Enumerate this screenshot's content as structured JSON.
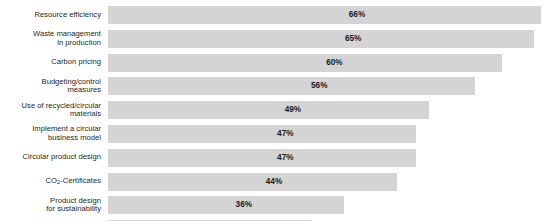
{
  "chart_data": {
    "type": "bar",
    "orientation": "horizontal",
    "title": "",
    "subtitle": "",
    "xlabel": "",
    "ylabel": "",
    "xlim": [
      0,
      70
    ],
    "grid": false,
    "legend": null,
    "value_suffix": "%",
    "categories": [
      "Resource efficiency",
      "Waste management\nin production",
      "Carbon pricing",
      "Budgeting/control\nmeasures",
      "Use of recycled/circular\nmaterials",
      "Implement a circular\nbusiness model",
      "Circular product design",
      "CO2-Certificates",
      "Product design\nfor sustainability",
      "Replenishment control\naccording to demand"
    ],
    "values": [
      66,
      65,
      60,
      56,
      49,
      47,
      47,
      44,
      36,
      31
    ],
    "value_labels": [
      "66%",
      "65%",
      "60%",
      "56%",
      "49%",
      "47%",
      "47%",
      "44%",
      "36%",
      "31%"
    ],
    "bar_color": "#d4d4d4",
    "value_label_color": "#1a1a1a",
    "label_color": "#231f20",
    "background_color": "#ffffff"
  },
  "rows": [
    {
      "label": "Resource efficiency",
      "label_line1": "Resource efficiency",
      "label_line2": "",
      "value": 66,
      "value_label": "66%"
    },
    {
      "label": "Waste management in production",
      "label_line1": "Waste management",
      "label_line2": "in production",
      "value": 65,
      "value_label": "65%"
    },
    {
      "label": "Carbon pricing",
      "label_line1": "Carbon pricing",
      "label_line2": "",
      "value": 60,
      "value_label": "60%"
    },
    {
      "label": "Budgeting/control measures",
      "label_line1": "Budgeting/control",
      "label_line2": "measures",
      "value": 56,
      "value_label": "56%"
    },
    {
      "label": "Use of recycled/circular materials",
      "label_line1": "Use of recycled/circular",
      "label_line2": "materials",
      "value": 49,
      "value_label": "49%"
    },
    {
      "label": "Implement a circular business model",
      "label_line1": "Implement a circular",
      "label_line2": "business model",
      "value": 47,
      "value_label": "47%"
    },
    {
      "label": "Circular product design",
      "label_line1": "Circular product design",
      "label_line2": "",
      "value": 47,
      "value_label": "47%"
    },
    {
      "label": "CO2-Certificates",
      "label_line1": "CO2-Certificates",
      "label_line2": "",
      "value": 44,
      "value_label": "44%",
      "has_subscript": true,
      "subscript_prefix": "CO",
      "subscript_char": "2",
      "subscript_suffix": "-Certificates"
    },
    {
      "label": "Product design for sustainability",
      "label_line1": "Product design",
      "label_line2": "for sustainability",
      "value": 36,
      "value_label": "36%"
    },
    {
      "label": "Replenishment control according to demand",
      "label_line1": "Replenishment control",
      "label_line2": "according to demand",
      "value": 31,
      "value_label": "31%"
    }
  ],
  "scale": {
    "max_value": 66,
    "max_bar_px": 433,
    "value_label_center_fraction": 0.575
  }
}
